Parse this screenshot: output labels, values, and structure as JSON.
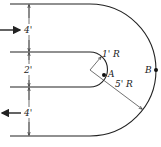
{
  "figure": {
    "type": "U-bend channel flow diagram",
    "dimensions": {
      "upper_channel_width": "4'",
      "gap_width": "2'",
      "lower_channel_width": "4'"
    },
    "radii": {
      "inner_radius": "1' R",
      "outer_radius": "5' R"
    },
    "points": {
      "inner_point": "A",
      "outer_point": "B"
    },
    "flow": {
      "inlet_direction": "right",
      "outlet_direction": "left"
    },
    "colors": {
      "line": "#222222",
      "background": "#ffffff"
    }
  }
}
